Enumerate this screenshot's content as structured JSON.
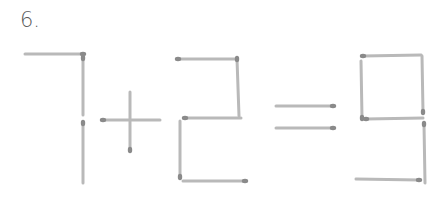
{
  "puzzle": {
    "number_label": "6.",
    "equation_shown": "7+2=9",
    "colors": {
      "stick": "#b9b9b9",
      "head": "#8a8a8a",
      "label": "#5a5a5a"
    },
    "glyphs": [
      {
        "symbol": "7",
        "sticks": [
          {
            "x1": 25,
            "y1": 54,
            "x2": 83,
            "y2": 54,
            "head": "end"
          },
          {
            "x1": 83,
            "y1": 58,
            "x2": 83,
            "y2": 115,
            "head": "start"
          },
          {
            "x1": 83,
            "y1": 123,
            "x2": 83,
            "y2": 183,
            "head": "start"
          }
        ]
      },
      {
        "symbol": "+",
        "sticks": [
          {
            "x1": 103,
            "y1": 120,
            "x2": 160,
            "y2": 120,
            "head": "start"
          },
          {
            "x1": 130,
            "y1": 92,
            "x2": 130,
            "y2": 150,
            "head": "end"
          }
        ]
      },
      {
        "symbol": "2",
        "sticks": [
          {
            "x1": 178,
            "y1": 59,
            "x2": 237,
            "y2": 59,
            "head": "start"
          },
          {
            "x1": 237,
            "y1": 59,
            "x2": 239,
            "y2": 116,
            "head": "start"
          },
          {
            "x1": 185,
            "y1": 118,
            "x2": 241,
            "y2": 118,
            "head": "start"
          },
          {
            "x1": 180,
            "y1": 121,
            "x2": 180,
            "y2": 177,
            "head": "end"
          },
          {
            "x1": 183,
            "y1": 181,
            "x2": 245,
            "y2": 181,
            "head": "end"
          }
        ]
      },
      {
        "symbol": "=",
        "sticks": [
          {
            "x1": 276,
            "y1": 106,
            "x2": 333,
            "y2": 106,
            "head": "end"
          },
          {
            "x1": 276,
            "y1": 128,
            "x2": 333,
            "y2": 128,
            "head": "end"
          }
        ]
      },
      {
        "symbol": "9",
        "sticks": [
          {
            "x1": 363,
            "y1": 56,
            "x2": 421,
            "y2": 55,
            "head": "start"
          },
          {
            "x1": 361,
            "y1": 61,
            "x2": 362,
            "y2": 118,
            "head": "end"
          },
          {
            "x1": 422,
            "y1": 56,
            "x2": 423,
            "y2": 112,
            "head": "end"
          },
          {
            "x1": 366,
            "y1": 119,
            "x2": 423,
            "y2": 118,
            "head": "start"
          },
          {
            "x1": 424,
            "y1": 124,
            "x2": 425,
            "y2": 183,
            "head": "start"
          },
          {
            "x1": 356,
            "y1": 179,
            "x2": 419,
            "y2": 180,
            "head": "end"
          }
        ]
      }
    ]
  }
}
